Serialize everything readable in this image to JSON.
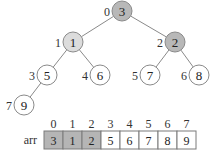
{
  "tree": {
    "edges": [
      {
        "from": 0,
        "to": 1
      },
      {
        "from": 0,
        "to": 2
      },
      {
        "from": 1,
        "to": 3
      },
      {
        "from": 1,
        "to": 4
      },
      {
        "from": 2,
        "to": 5
      },
      {
        "from": 2,
        "to": 6
      },
      {
        "from": 3,
        "to": 7
      }
    ],
    "nodes": [
      {
        "index": "0",
        "value": "3",
        "x": 122,
        "y": 11,
        "fill": "#b8b8b8"
      },
      {
        "index": "1",
        "value": "1",
        "x": 73,
        "y": 42,
        "fill": "#dcdcdc"
      },
      {
        "index": "2",
        "value": "2",
        "x": 175,
        "y": 42,
        "fill": "#b8b8b8"
      },
      {
        "index": "3",
        "value": "5",
        "x": 47,
        "y": 75,
        "fill": "#ffffff"
      },
      {
        "index": "4",
        "value": "6",
        "x": 100,
        "y": 75,
        "fill": "#ffffff"
      },
      {
        "index": "5",
        "value": "7",
        "x": 150,
        "y": 75,
        "fill": "#ffffff"
      },
      {
        "index": "6",
        "value": "8",
        "x": 199,
        "y": 75,
        "fill": "#ffffff"
      },
      {
        "index": "7",
        "value": "9",
        "x": 24,
        "y": 105,
        "fill": "#ffffff"
      }
    ],
    "node_radius": 10,
    "stroke_color": "#8a8a8a"
  },
  "array": {
    "label": "arr",
    "indices": [
      "0",
      "1",
      "2",
      "3",
      "4",
      "5",
      "6",
      "7"
    ],
    "values": [
      "3",
      "1",
      "2",
      "5",
      "6",
      "7",
      "8",
      "9"
    ],
    "highlighted": [
      true,
      true,
      true,
      false,
      false,
      false,
      false,
      false
    ],
    "highlight_fill": "#b5b5b5",
    "plain_fill": "#ffffff",
    "x": 44,
    "y": 131,
    "cell_width": 19,
    "cell_height": 18
  }
}
